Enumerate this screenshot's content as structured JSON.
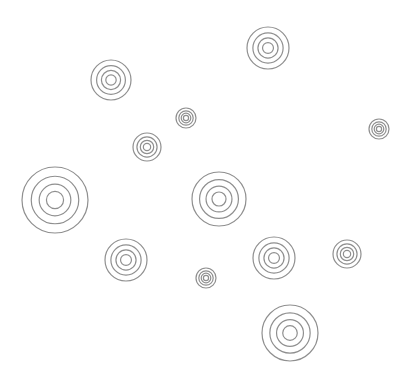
{
  "canvas": {
    "width": 410,
    "height": 383,
    "background": "#ffffff",
    "stroke_color": "#8f8f8f",
    "stroke_width": 1.2,
    "ring_ratios": [
      1.0,
      0.72,
      0.48,
      0.26
    ]
  },
  "targets": [
    {
      "cx": 111,
      "cy": 80,
      "r": 20
    },
    {
      "cx": 268,
      "cy": 48,
      "r": 21
    },
    {
      "cx": 186,
      "cy": 118,
      "r": 10
    },
    {
      "cx": 147,
      "cy": 147,
      "r": 14
    },
    {
      "cx": 379,
      "cy": 129,
      "r": 10
    },
    {
      "cx": 55,
      "cy": 200,
      "r": 33
    },
    {
      "cx": 219,
      "cy": 199,
      "r": 27
    },
    {
      "cx": 126,
      "cy": 260,
      "r": 21
    },
    {
      "cx": 274,
      "cy": 258,
      "r": 21
    },
    {
      "cx": 347,
      "cy": 254,
      "r": 14
    },
    {
      "cx": 206,
      "cy": 278,
      "r": 10
    },
    {
      "cx": 290,
      "cy": 333,
      "r": 28
    }
  ]
}
